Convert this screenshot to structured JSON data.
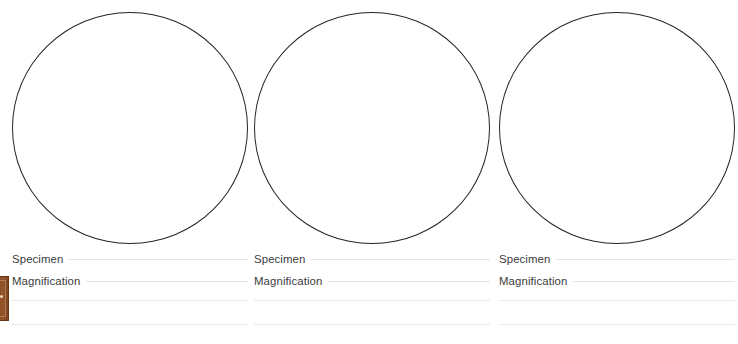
{
  "worksheet": {
    "panel_count": 3,
    "circle_stroke_color": "#262626",
    "rule_color": "#e3e4e6",
    "label_color": "#3b3b3b",
    "background_color": "#ffffff"
  },
  "panels": [
    {
      "drawing_area_name": "field-of-view-circle-1",
      "fields": [
        {
          "label": "Specimen",
          "value": ""
        },
        {
          "label": "Magnification",
          "value": ""
        },
        {
          "label": "",
          "value": ""
        },
        {
          "label": "",
          "value": ""
        }
      ]
    },
    {
      "drawing_area_name": "field-of-view-circle-2",
      "fields": [
        {
          "label": "Specimen",
          "value": ""
        },
        {
          "label": "Magnification",
          "value": ""
        },
        {
          "label": "",
          "value": ""
        },
        {
          "label": "",
          "value": ""
        }
      ]
    },
    {
      "drawing_area_name": "field-of-view-circle-3",
      "fields": [
        {
          "label": "Specimen",
          "value": ""
        },
        {
          "label": "Magnification",
          "value": ""
        },
        {
          "label": "",
          "value": ""
        },
        {
          "label": "",
          "value": ""
        }
      ]
    }
  ],
  "edge_graphic": {
    "name": "wooden-door-graphic",
    "color": "#8a4a22",
    "border_color": "#6a3616"
  }
}
